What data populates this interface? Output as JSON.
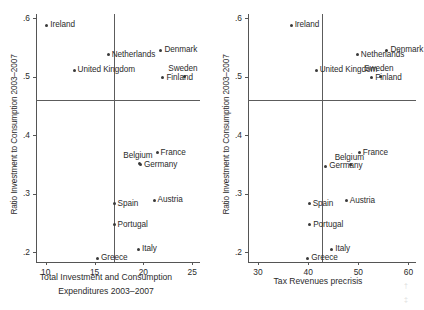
{
  "chart_data": [
    {
      "type": "scatter",
      "panel": "left",
      "title": "",
      "xlabel": "Total Investment and Consumption Expenditures 2003–2007",
      "ylabel": "Ratio Investment to Consumption 2003–2007",
      "xlim": [
        9.0,
        25.8
      ],
      "ylim": [
        0.183,
        0.607
      ],
      "xticks": [
        10,
        15,
        20,
        25
      ],
      "xticklabels": [
        "10",
        "15",
        "20",
        "25"
      ],
      "yticks": [
        0.2,
        0.3,
        0.4,
        0.5,
        0.6
      ],
      "yticklabels": [
        ".2",
        ".3",
        ".4",
        ".5",
        ".6"
      ],
      "grid": false,
      "legend": false,
      "reference_lines": {
        "horizontal": 0.46,
        "vertical": 17.0
      },
      "points": [
        {
          "label": "Ireland",
          "x": 10.1,
          "y": 0.588,
          "label_pos": "right"
        },
        {
          "label": "Netherlands",
          "x": 16.4,
          "y": 0.537,
          "label_pos": "right"
        },
        {
          "label": "Denmark",
          "x": 21.8,
          "y": 0.545,
          "label_pos": "right"
        },
        {
          "label": "United Kingdom",
          "x": 12.9,
          "y": 0.511,
          "label_pos": "right"
        },
        {
          "label": "Sweden",
          "x": 24.2,
          "y": 0.501,
          "label_pos": "above"
        },
        {
          "label": "Finland",
          "x": 22.0,
          "y": 0.498,
          "label_pos": "right"
        },
        {
          "label": "France",
          "x": 21.4,
          "y": 0.37,
          "label_pos": "right"
        },
        {
          "label": "Belgium",
          "x": 19.6,
          "y": 0.352,
          "label_pos": "above"
        },
        {
          "label": "Germany",
          "x": 19.7,
          "y": 0.349,
          "label_pos": "right"
        },
        {
          "label": "Austria",
          "x": 21.1,
          "y": 0.289,
          "label_pos": "right"
        },
        {
          "label": "Spain",
          "x": 17.0,
          "y": 0.283,
          "label_pos": "right"
        },
        {
          "label": "Portugal",
          "x": 17.0,
          "y": 0.247,
          "label_pos": "right"
        },
        {
          "label": "Italy",
          "x": 19.5,
          "y": 0.205,
          "label_pos": "right"
        },
        {
          "label": "Greece",
          "x": 15.3,
          "y": 0.189,
          "label_pos": "right"
        }
      ]
    },
    {
      "type": "scatter",
      "panel": "right",
      "title": "",
      "xlabel": "Tax Revenues precrisis",
      "ylabel": "Ratio Investment to Consumption 2003–2007",
      "xlim": [
        28.0,
        61.5
      ],
      "ylim": [
        0.183,
        0.607
      ],
      "xticks": [
        30,
        40,
        50,
        60
      ],
      "xticklabels": [
        "30",
        "40",
        "50",
        "60"
      ],
      "yticks": [
        0.2,
        0.3,
        0.4,
        0.5,
        0.6
      ],
      "yticklabels": [
        ".2",
        ".3",
        ".4",
        ".5",
        ".6"
      ],
      "grid": false,
      "legend": false,
      "reference_lines": {
        "horizontal": 0.46,
        "vertical": 42.8
      },
      "points": [
        {
          "label": "Ireland",
          "x": 36.6,
          "y": 0.588,
          "label_pos": "right"
        },
        {
          "label": "Netherlands",
          "x": 49.8,
          "y": 0.537,
          "label_pos": "right"
        },
        {
          "label": "Denmark",
          "x": 55.7,
          "y": 0.545,
          "label_pos": "right"
        },
        {
          "label": "United Kingdom",
          "x": 41.6,
          "y": 0.511,
          "label_pos": "right"
        },
        {
          "label": "Sweden",
          "x": 54.4,
          "y": 0.501,
          "label_pos": "above"
        },
        {
          "label": "Finland",
          "x": 52.7,
          "y": 0.498,
          "label_pos": "right"
        },
        {
          "label": "France",
          "x": 50.2,
          "y": 0.37,
          "label_pos": "right"
        },
        {
          "label": "Belgium",
          "x": 48.5,
          "y": 0.349,
          "label_pos": "above"
        },
        {
          "label": "Germany",
          "x": 43.5,
          "y": 0.347,
          "label_pos": "right"
        },
        {
          "label": "Austria",
          "x": 47.6,
          "y": 0.288,
          "label_pos": "right"
        },
        {
          "label": "Spain",
          "x": 40.2,
          "y": 0.283,
          "label_pos": "right"
        },
        {
          "label": "Portugal",
          "x": 40.3,
          "y": 0.247,
          "label_pos": "right"
        },
        {
          "label": "Italy",
          "x": 44.7,
          "y": 0.205,
          "label_pos": "right"
        },
        {
          "label": "Greece",
          "x": 39.9,
          "y": 0.189,
          "label_pos": "right"
        }
      ]
    }
  ],
  "figure": {
    "left_panel": {
      "xlabel_line1": "Total Investment and Consumption",
      "xlabel_line2": "Expenditures 2003–2007",
      "ylabel": "Ratio Investment to Consumption 2003–2007"
    },
    "right_panel": {
      "xlabel_line1": "Tax Revenues precrisis",
      "xlabel_line2": "",
      "ylabel": "Ratio Investment to Consumption 2003–2007"
    },
    "colors": {
      "marker": "#3a3a3a",
      "axis": "#555555",
      "reference_line": "#5c5c5c",
      "text": "#2b2b2b",
      "background": "#ffffff"
    }
  }
}
